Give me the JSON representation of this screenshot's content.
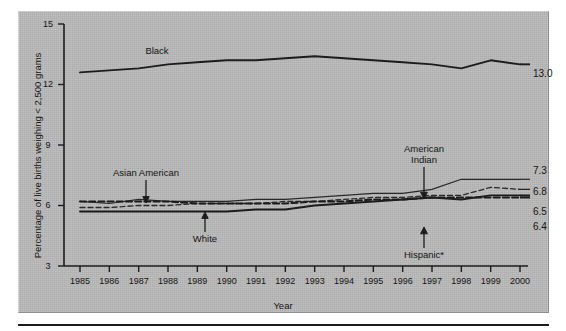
{
  "figure": {
    "panel_bg": "#b9b9b9",
    "axis_color": "#1c1c1c"
  },
  "chart_data": {
    "type": "line",
    "title": "",
    "xlabel": "Year",
    "ylabel": "Percentage of live births weighing < 2,500 grams",
    "x": [
      1985,
      1986,
      1987,
      1988,
      1989,
      1990,
      1991,
      1992,
      1993,
      1994,
      1995,
      1996,
      1997,
      1998,
      1999,
      2000
    ],
    "xtick_labels": [
      "1985",
      "1986",
      "1987",
      "1988",
      "1989",
      "1990",
      "1991",
      "1992",
      "1993",
      "1994",
      "1995",
      "1996",
      "1997",
      "1998",
      "1999",
      "2000"
    ],
    "ytick_labels": [
      "3",
      "6",
      "9",
      "12",
      "15"
    ],
    "yticks": [
      3,
      6,
      9,
      12,
      15
    ],
    "ylim": [
      3,
      15
    ],
    "xlim": [
      1985,
      2000
    ],
    "grid": false,
    "legend": "annotations-inline",
    "series": [
      {
        "name": "Black",
        "style": "solid-thick",
        "color": "#1c1c1c",
        "end_label": "13.0",
        "values": [
          12.6,
          12.7,
          12.8,
          13.0,
          13.1,
          13.2,
          13.2,
          13.3,
          13.4,
          13.3,
          13.2,
          13.1,
          13.0,
          12.8,
          13.2,
          13.0
        ]
      },
      {
        "name": "American Indian",
        "style": "solid-thin",
        "color": "#2a2a2a",
        "end_label": "7.3",
        "values": [
          6.2,
          6.1,
          6.3,
          6.2,
          6.2,
          6.2,
          6.3,
          6.3,
          6.4,
          6.5,
          6.6,
          6.6,
          6.8,
          7.3,
          7.3,
          7.3
        ]
      },
      {
        "name": "Asian American",
        "style": "dashed-thin",
        "color": "#2a2a2a",
        "end_label": "6.8",
        "values": [
          5.9,
          5.9,
          6.0,
          6.0,
          6.1,
          6.1,
          6.1,
          6.2,
          6.2,
          6.3,
          6.4,
          6.4,
          6.5,
          6.5,
          6.9,
          6.8
        ]
      },
      {
        "name": "White",
        "style": "solid-thick",
        "color": "#1c1c1c",
        "end_label": "6.5",
        "values": [
          5.7,
          5.7,
          5.7,
          5.7,
          5.7,
          5.7,
          5.8,
          5.8,
          6.0,
          6.1,
          6.2,
          6.3,
          6.4,
          6.3,
          6.5,
          6.5
        ]
      },
      {
        "name": "Hispanic*",
        "style": "dashed-thick",
        "color": "#1c1c1c",
        "end_label": "6.4",
        "values": [
          6.2,
          6.2,
          6.2,
          6.2,
          6.1,
          6.1,
          6.1,
          6.1,
          6.2,
          6.2,
          6.3,
          6.3,
          6.4,
          6.4,
          6.4,
          6.4
        ]
      }
    ],
    "annotations": [
      {
        "text": "Black",
        "series": "Black"
      },
      {
        "text": "Asian American",
        "series": "Asian American"
      },
      {
        "text": "White",
        "series": "White"
      },
      {
        "text": "American Indian",
        "series": "American Indian"
      },
      {
        "text": "Hispanic*",
        "series": "Hispanic*"
      }
    ]
  },
  "annotations": {
    "black": "Black",
    "asian_american": "Asian American",
    "white": "White",
    "american_indian_line1": "American",
    "american_indian_line2": "Indian",
    "hispanic": "Hispanic*"
  },
  "end_labels": {
    "black": "13.0",
    "american_indian": "7.3",
    "asian_american": "6.8",
    "white": "6.5",
    "hispanic": "6.4"
  },
  "axes": {
    "y_title": "Percentage of live births weighing < 2,500 grams",
    "x_title": "Year",
    "y_ticks": [
      "15",
      "12",
      "9",
      "6",
      "3"
    ],
    "x_ticks": [
      "1985",
      "1986",
      "1987",
      "1988",
      "1989",
      "1990",
      "1991",
      "1992",
      "1993",
      "1994",
      "1995",
      "1996",
      "1997",
      "1998",
      "1999",
      "2000"
    ]
  }
}
